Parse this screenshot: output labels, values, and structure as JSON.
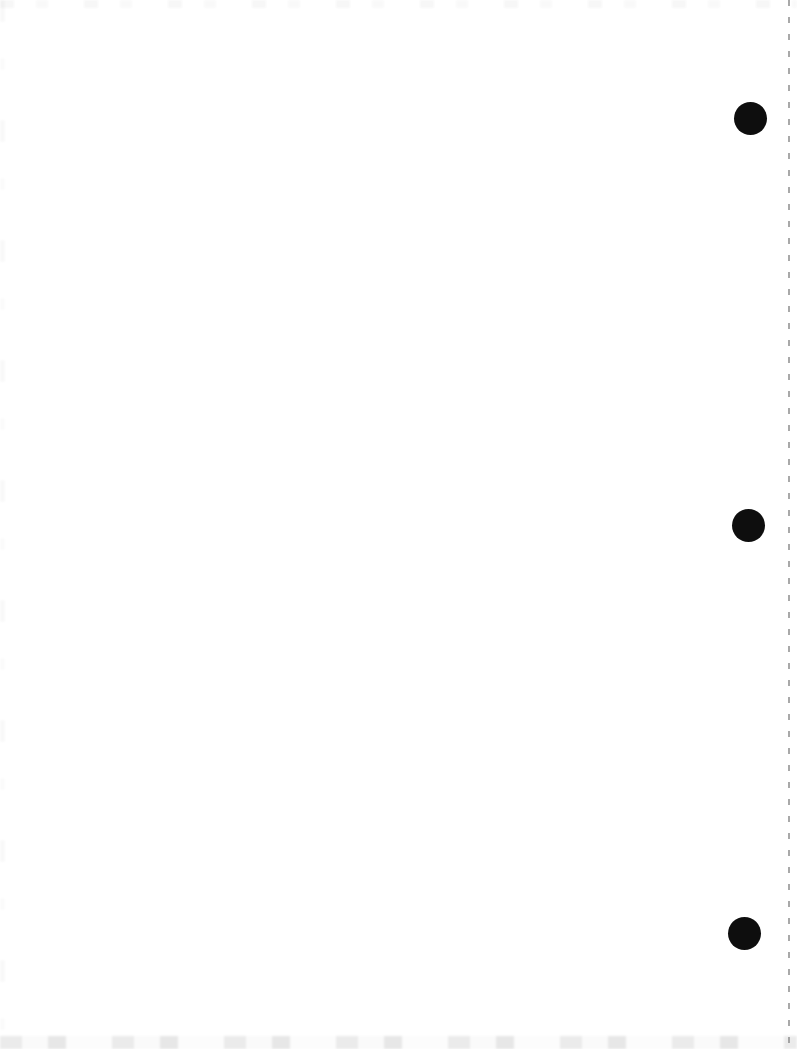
{
  "page": {
    "background_color": "#ffffff",
    "width_px": 797,
    "height_px": 1049,
    "visible_text": ""
  },
  "punch_holes": {
    "color": "#0e0e0e",
    "diameter_px": 33,
    "items": [
      {
        "cx_px": 750,
        "cy_px": 118
      },
      {
        "cx_px": 748,
        "cy_px": 525
      },
      {
        "cx_px": 744,
        "cy_px": 933
      }
    ]
  },
  "perforation_edge": {
    "x_px": 788,
    "width_px": 2,
    "color": "#8c8c8c",
    "dash_px": 6,
    "gap_px": 11
  },
  "scan_artifacts": {
    "top_edge_shade": "#ededed",
    "bottom_edge_shade": "#e3e3e3",
    "left_edge_shade": "#f2f2f2"
  }
}
